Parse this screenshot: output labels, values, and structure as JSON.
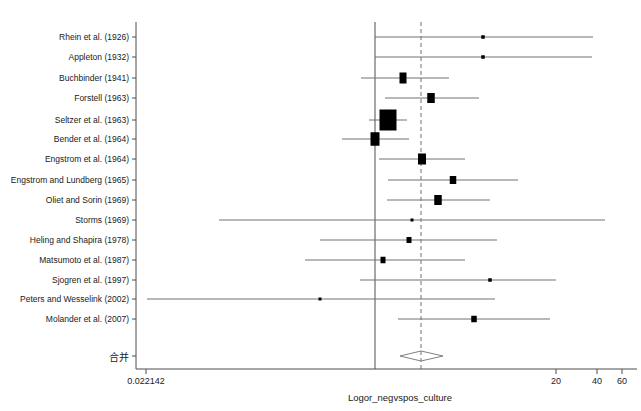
{
  "chart_data": {
    "type": "forest",
    "title": "",
    "xlabel": "Logor_negvspos_culture",
    "ylabel": "",
    "grid": false,
    "legend": "none",
    "null_line_label": "0.022142",
    "axis": {
      "ticks": [
        {
          "label": "0.022142",
          "x": 146
        },
        {
          "label": "20",
          "x": 556
        },
        {
          "label": "40",
          "x": 597
        },
        {
          "label": "60",
          "x": 622
        }
      ],
      "axis_y": 369,
      "left_edge_x": 136,
      "right_edge_x": 637,
      "reference_line_x": 375,
      "pooled_line_x": 421
    },
    "studies": [
      {
        "label": "Rhein et al. (1926)",
        "y": 37,
        "est_x": 483,
        "lo_x": 375,
        "hi_x": 593,
        "box_w": 3.5,
        "box_h": 3.5
      },
      {
        "label": "Appleton (1932)",
        "y": 57,
        "est_x": 483,
        "lo_x": 375,
        "hi_x": 592,
        "box_w": 3.5,
        "box_h": 3.5
      },
      {
        "label": "Buchbinder (1941)",
        "y": 78,
        "est_x": 403,
        "lo_x": 361,
        "hi_x": 449,
        "box_w": 7.0,
        "box_h": 11.0
      },
      {
        "label": "Forstell (1963)",
        "y": 98,
        "est_x": 431,
        "lo_x": 385,
        "hi_x": 479,
        "box_w": 7.5,
        "box_h": 10.0
      },
      {
        "label": "Seltzer et al. (1963)",
        "y": 120,
        "est_x": 388,
        "lo_x": 369,
        "hi_x": 407,
        "box_w": 17.0,
        "box_h": 21.0
      },
      {
        "label": "Bender et al. (1964)",
        "y": 139,
        "est_x": 375,
        "lo_x": 342,
        "hi_x": 409,
        "box_w": 9.0,
        "box_h": 13.5
      },
      {
        "label": "Engstrom et al. (1964)",
        "y": 159,
        "est_x": 422,
        "lo_x": 379,
        "hi_x": 465,
        "box_w": 8.0,
        "box_h": 11.0
      },
      {
        "label": "Engstrom and Lundberg (1965)",
        "y": 180,
        "est_x": 453,
        "lo_x": 388,
        "hi_x": 518,
        "box_w": 6.5,
        "box_h": 8.0
      },
      {
        "label": "Oliet and Sorin (1969)",
        "y": 200,
        "est_x": 438,
        "lo_x": 387,
        "hi_x": 490,
        "box_w": 7.5,
        "box_h": 10.0
      },
      {
        "label": "Storms (1969)",
        "y": 220,
        "est_x": 412,
        "lo_x": 219,
        "hi_x": 605,
        "box_w": 3.0,
        "box_h": 3.0
      },
      {
        "label": "Heling and Shapira (1978)",
        "y": 240,
        "est_x": 409,
        "lo_x": 320,
        "hi_x": 497,
        "box_w": 5.0,
        "box_h": 6.0
      },
      {
        "label": "Matsumoto et al. (1987)",
        "y": 260,
        "est_x": 383,
        "lo_x": 305,
        "hi_x": 465,
        "box_w": 5.0,
        "box_h": 6.5
      },
      {
        "label": "Sjogren et al. (1997)",
        "y": 280,
        "est_x": 490,
        "lo_x": 360,
        "hi_x": 556,
        "box_w": 3.5,
        "box_h": 3.5
      },
      {
        "label": "Peters and Wesselink (2002)",
        "y": 299,
        "est_x": 320,
        "lo_x": 147,
        "hi_x": 495,
        "box_w": 3.0,
        "box_h": 3.0
      },
      {
        "label": "Molander et al. (2007)",
        "y": 319,
        "est_x": 474,
        "lo_x": 398,
        "hi_x": 550,
        "box_w": 5.5,
        "box_h": 6.5
      }
    ],
    "summary": {
      "label": "合并",
      "y": 356,
      "center_x": 421,
      "lo_x": 400,
      "hi_x": 443,
      "half_height": 5
    }
  },
  "colors": {
    "marker": "#000000",
    "axis": "#4d4d4d",
    "whisker": "#737373",
    "reference_line": "#4d4d4d",
    "pooled_line": "#999999",
    "diamond": "#808080",
    "text": "#1a1a1a",
    "background": "#ffffff"
  }
}
